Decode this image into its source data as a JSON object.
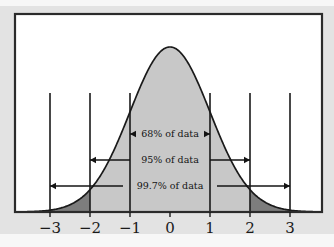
{
  "figure": {
    "title": "",
    "background_color": "#f7f7f7",
    "band_color": "#e3e3e3",
    "frame_color": "#2b2b2b",
    "plot_background": "#ffffff"
  },
  "chart_data": {
    "type": "area",
    "title": "",
    "xlabel": "",
    "ylabel": "",
    "distribution": "standard normal",
    "mean": 0,
    "sd": 1,
    "xlim": [
      -3.9,
      3.8
    ],
    "ylim": [
      0,
      0.44
    ],
    "grid": false,
    "legend": null,
    "x_tick_labels": [
      "−3",
      "−2",
      "−1",
      "0",
      "1",
      "2",
      "3"
    ],
    "x_tick_values": [
      -3,
      -2,
      -1,
      0,
      1,
      2,
      3
    ],
    "x": [
      -3.9,
      -3.6,
      -3.3,
      -3.0,
      -2.7,
      -2.4,
      -2.1,
      -1.8,
      -1.5,
      -1.2,
      -0.9,
      -0.6,
      -0.3,
      0.0,
      0.3,
      0.6,
      0.9,
      1.2,
      1.5,
      1.8,
      2.1,
      2.4,
      2.7,
      3.0,
      3.3,
      3.6,
      3.8
    ],
    "y": [
      0.0002,
      0.0006,
      0.0017,
      0.0044,
      0.0104,
      0.0224,
      0.044,
      0.079,
      0.1295,
      0.1942,
      0.2661,
      0.3332,
      0.3814,
      0.3989,
      0.3814,
      0.3332,
      0.2661,
      0.1942,
      0.1295,
      0.079,
      0.044,
      0.0224,
      0.0104,
      0.0044,
      0.0017,
      0.0006,
      0.0003
    ],
    "fill_color_main": "#c8c8c8",
    "fill_color_tails": "#7d7d7d",
    "curve_color": "#1a1a1a",
    "tail_regions": [
      {
        "from": -3,
        "to": -2,
        "label": "lower tail"
      },
      {
        "from": 2,
        "to": 3,
        "label": "upper tail"
      }
    ],
    "vertical_lines": [
      -3,
      -2,
      -1,
      1,
      2,
      3
    ],
    "annotations": [
      {
        "label": "68% of data",
        "from": -1,
        "to": 1,
        "value": 68
      },
      {
        "label": "95% of data",
        "from": -2,
        "to": 2,
        "value": 95
      },
      {
        "label": "99.7% of data",
        "from": -3,
        "to": 3,
        "value": 99.7
      }
    ]
  }
}
